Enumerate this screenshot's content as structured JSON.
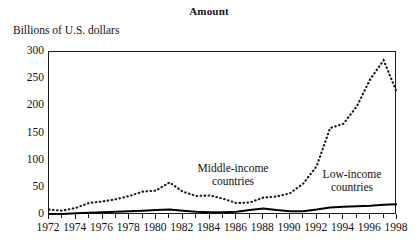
{
  "figure": {
    "title": "Amount",
    "y_axis_label": "Billions of U.S. dollars"
  },
  "annotations": {
    "middle_income_line1": "Middle-income",
    "middle_income_line2": "countries",
    "low_income_line1": "Low-income",
    "low_income_line2": "countries"
  },
  "colors": {
    "axis": "#1a1a1a",
    "middle_income": "#1a1a1a",
    "low_income": "#000000",
    "background": "#ffffff"
  },
  "chart_data": {
    "type": "line",
    "title": "Amount",
    "xlabel": "",
    "ylabel": "Billions of U.S. dollars",
    "xlim": [
      1972,
      1998
    ],
    "ylim": [
      0,
      300
    ],
    "yticks": [
      0,
      50,
      100,
      150,
      200,
      250,
      300
    ],
    "ytick_labels": [
      "0",
      "50",
      "100",
      "150",
      "200",
      "250",
      "300"
    ],
    "xticks": [
      1972,
      1974,
      1976,
      1978,
      1980,
      1982,
      1984,
      1986,
      1988,
      1990,
      1992,
      1994,
      1996,
      1998
    ],
    "xtick_labels": [
      "1972",
      "1974",
      "1976",
      "1978",
      "1980",
      "1982",
      "1984",
      "1986",
      "1988",
      "1990",
      "1992",
      "1994",
      "1996",
      "1998"
    ],
    "x_minor_tick_step": 1,
    "grid": false,
    "legend": "inline-annotations",
    "x": [
      1972,
      1973,
      1974,
      1975,
      1976,
      1977,
      1978,
      1979,
      1980,
      1981,
      1982,
      1983,
      1984,
      1985,
      1986,
      1987,
      1988,
      1989,
      1990,
      1991,
      1992,
      1993,
      1994,
      1995,
      1996,
      1997,
      1998
    ],
    "series": [
      {
        "name": "Middle-income countries",
        "style": "dotted",
        "values": [
          10,
          8,
          13,
          22,
          25,
          29,
          35,
          43,
          45,
          60,
          43,
          35,
          36,
          30,
          22,
          23,
          32,
          34,
          40,
          58,
          90,
          160,
          168,
          200,
          250,
          285,
          225
        ]
      },
      {
        "name": "Low-income countries",
        "style": "solid",
        "values": [
          2,
          2,
          3,
          4,
          5,
          6,
          7,
          8,
          9,
          10,
          8,
          6,
          5,
          5,
          6,
          9,
          12,
          9,
          7,
          7,
          10,
          14,
          15,
          16,
          17,
          19,
          20
        ]
      }
    ]
  }
}
